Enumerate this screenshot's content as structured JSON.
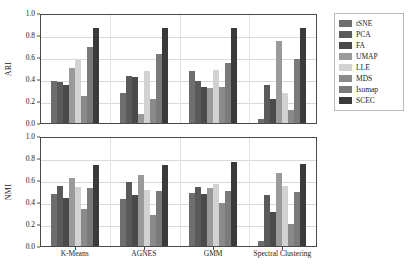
{
  "chart_data": {
    "type": "bar",
    "title": "",
    "subtitle": "",
    "orientation": "vertical",
    "grouping": "grouped",
    "grid": true,
    "grid_axis": "y",
    "legend_position": "right",
    "categories": [
      "K-Means",
      "AGNES",
      "GMM",
      "Spectral Clustering"
    ],
    "xlabel": "",
    "panels": [
      {
        "id": "ari",
        "ylabel": "ARI",
        "ylim": [
          0.0,
          1.0
        ],
        "yticks": [
          "0.0",
          "0.2",
          "0.4",
          "0.6",
          "0.8",
          "1.0"
        ],
        "ytick_values": [
          0.0,
          0.2,
          0.4,
          0.6,
          0.8,
          1.0
        ],
        "series": [
          {
            "name": "tSNE",
            "color": "#6e6e6e",
            "values": [
              0.38,
              0.27,
              0.47,
              0.04
            ]
          },
          {
            "name": "PCA",
            "color": "#5a5a5a",
            "values": [
              0.37,
              0.43,
              0.38,
              0.35
            ]
          },
          {
            "name": "FA",
            "color": "#4a4a4a",
            "values": [
              0.35,
              0.42,
              0.33,
              0.22
            ]
          },
          {
            "name": "UMAP",
            "color": "#9a9a9a",
            "values": [
              0.5,
              0.08,
              0.32,
              0.75
            ]
          },
          {
            "name": "LLE",
            "color": "#d2d2d2",
            "values": [
              0.57,
              0.47,
              0.48,
              0.27
            ]
          },
          {
            "name": "MDS",
            "color": "#8a8a8a",
            "values": [
              0.25,
              0.22,
              0.33,
              0.12
            ]
          },
          {
            "name": "Isomap",
            "color": "#7a7a7a",
            "values": [
              0.69,
              0.63,
              0.55,
              0.58
            ]
          },
          {
            "name": "SCEC",
            "color": "#3a3a3a",
            "values": [
              0.86,
              0.86,
              0.86,
              0.86
            ]
          }
        ]
      },
      {
        "id": "nmi",
        "ylabel": "NMI",
        "ylim": [
          0.0,
          1.0
        ],
        "yticks": [
          "0.0",
          "0.2",
          "0.4",
          "0.6",
          "0.8",
          "1.0"
        ],
        "ytick_values": [
          0.0,
          0.2,
          0.4,
          0.6,
          0.8,
          1.0
        ],
        "series": [
          {
            "name": "tSNE",
            "color": "#6e6e6e",
            "values": [
              0.47,
              0.43,
              0.48,
              0.05
            ]
          },
          {
            "name": "PCA",
            "color": "#5a5a5a",
            "values": [
              0.55,
              0.58,
              0.54,
              0.46
            ]
          },
          {
            "name": "FA",
            "color": "#4a4a4a",
            "values": [
              0.44,
              0.46,
              0.47,
              0.31
            ]
          },
          {
            "name": "UMAP",
            "color": "#9a9a9a",
            "values": [
              0.62,
              0.65,
              0.53,
              0.66
            ]
          },
          {
            "name": "LLE",
            "color": "#d2d2d2",
            "values": [
              0.54,
              0.51,
              0.56,
              0.55
            ]
          },
          {
            "name": "MDS",
            "color": "#8a8a8a",
            "values": [
              0.34,
              0.28,
              0.39,
              0.2
            ]
          },
          {
            "name": "Isomap",
            "color": "#7a7a7a",
            "values": [
              0.53,
              0.5,
              0.5,
              0.49
            ]
          },
          {
            "name": "SCEC",
            "color": "#3a3a3a",
            "values": [
              0.74,
              0.74,
              0.76,
              0.75
            ]
          }
        ]
      }
    ],
    "legend": [
      {
        "label": "tSNE",
        "color": "#6e6e6e"
      },
      {
        "label": "PCA",
        "color": "#5a5a5a"
      },
      {
        "label": "FA",
        "color": "#4a4a4a"
      },
      {
        "label": "UMAP",
        "color": "#9a9a9a"
      },
      {
        "label": "LLE",
        "color": "#d2d2d2"
      },
      {
        "label": "MDS",
        "color": "#8a8a8a"
      },
      {
        "label": "Isomap",
        "color": "#7a7a7a"
      },
      {
        "label": "SCEC",
        "color": "#3a3a3a"
      }
    ],
    "colors": {
      "axis": "#4a4a4a",
      "grid": "#d9d9d9",
      "text": "#1a1a1a",
      "background": "#ffffff",
      "legend_border": "#b9b9b9"
    }
  }
}
